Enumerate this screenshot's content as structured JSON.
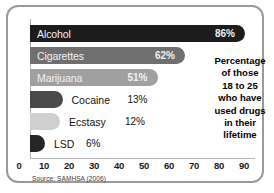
{
  "chart_data": {
    "type": "bar",
    "orientation": "horizontal",
    "title": "",
    "categories": [
      "Alcohol",
      "Cigarettes",
      "Marijuana",
      "Cocaine",
      "Ecstasy",
      "LSD"
    ],
    "values": [
      86,
      62,
      51,
      13,
      12,
      6
    ],
    "value_labels": [
      "86%",
      "62%",
      "51%",
      "13%",
      "12%",
      "6%"
    ],
    "xlabel": "",
    "ylabel": "",
    "xlim": [
      0,
      90
    ],
    "xticks": [
      "0",
      "10",
      "20",
      "30",
      "40",
      "50",
      "60",
      "70",
      "80",
      "90"
    ],
    "grid": false,
    "legend": "none",
    "annotation": "Percentage of those 18 to 25 who have used drugs in their lifetime",
    "source": "Source: SAMHSA (2006)",
    "series": [
      {
        "name": "Lifetime use",
        "values": [
          86,
          62,
          51,
          13,
          12,
          6
        ]
      }
    ],
    "bar_colors": [
      "#1c1c1c",
      "#6f6f6f",
      "#a0a0a0",
      "#4a4a4a",
      "#cfcfcf",
      "#262626"
    ],
    "label_inside": [
      true,
      true,
      true,
      false,
      false,
      false
    ]
  },
  "annotation": {
    "lines": [
      "Percentage",
      "of those",
      "18 to 25",
      "who have",
      "used drugs",
      "in their",
      "lifetime"
    ]
  },
  "footer": {
    "source": "Source: SAMHSA (2006)"
  }
}
